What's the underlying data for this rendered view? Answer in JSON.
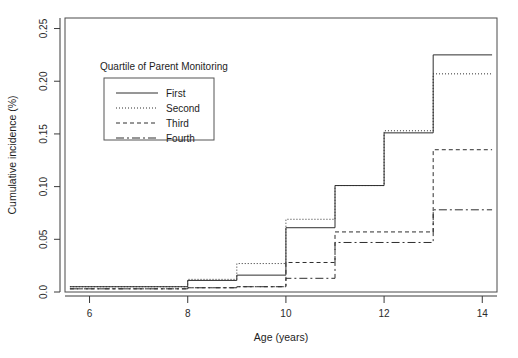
{
  "chart_data": {
    "type": "line",
    "subtype": "step",
    "title": "",
    "xlabel": "Age (years)",
    "ylabel": "Cumulative incidence (%)",
    "xlim": [
      5.5,
      14.3
    ],
    "ylim": [
      0.0,
      0.26
    ],
    "xticks": [
      6,
      8,
      10,
      12,
      14
    ],
    "xtick_labels": [
      "6",
      "8",
      "10",
      "12",
      "14"
    ],
    "yticks": [
      0.0,
      0.05,
      0.1,
      0.15,
      0.2,
      0.25
    ],
    "ytick_labels": [
      "0.0",
      "0.05",
      "0.10",
      "0.15",
      "0.20",
      "0.25"
    ],
    "grid": false,
    "legend_position": "upper-left-inside",
    "legend_title": "Quartile of Parent Monitoring",
    "x": [
      5.6,
      8,
      9,
      10,
      11,
      12,
      13,
      14.2
    ],
    "series": [
      {
        "name": "First",
        "dash": "solid",
        "values": [
          0.005,
          0.011,
          0.016,
          0.061,
          0.101,
          0.151,
          0.225,
          0.225
        ]
      },
      {
        "name": "Second",
        "dash": "dotted",
        "values": [
          0.005,
          0.012,
          0.027,
          0.069,
          0.101,
          0.153,
          0.207,
          0.207
        ]
      },
      {
        "name": "Third",
        "dash": "short-dash",
        "values": [
          0.003,
          0.004,
          0.005,
          0.028,
          0.057,
          0.057,
          0.135,
          0.135
        ]
      },
      {
        "name": "Fourth",
        "dash": "long-dash",
        "values": [
          0.003,
          0.004,
          0.005,
          0.013,
          0.047,
          0.047,
          0.078,
          0.078
        ]
      }
    ]
  },
  "figure": {
    "background_color": "#ffffff",
    "axis_color": "#2e2e2e"
  }
}
